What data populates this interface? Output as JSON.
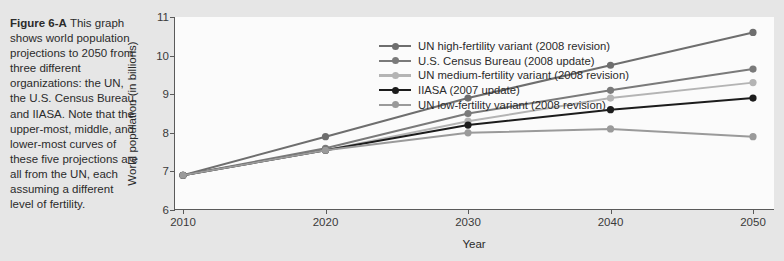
{
  "caption": {
    "label": "Figure 6-A",
    "text": "This graph shows world population projections to 2050 from three different organizations: the UN, the U.S. Census Bureau, and IIASA. Note that the upper-most, middle, and lower-most curves of these five projections are all from the UN, each assuming a different level of fertility."
  },
  "chart_data": {
    "type": "line",
    "title": "",
    "xlabel": "Year",
    "ylabel": "World population (in billions)",
    "x": [
      2010,
      2020,
      2030,
      2040,
      2050
    ],
    "xticklabels": [
      "2010",
      "2020",
      "2030",
      "2040",
      "2050"
    ],
    "yticklabels": [
      "6",
      "7",
      "8",
      "9",
      "10",
      "11"
    ],
    "yticks": [
      6,
      7,
      8,
      9,
      10,
      11
    ],
    "xlim": [
      2010,
      2050
    ],
    "ylim": [
      6,
      11
    ],
    "grid": false,
    "legend_position": "top-left inside plot area",
    "series": [
      {
        "name": "UN high-fertility variant (2008 revision)",
        "color": "#6e6e6e",
        "values": [
          6.9,
          7.9,
          8.9,
          9.75,
          10.6
        ]
      },
      {
        "name": "U.S. Census Bureau (2008 update)",
        "color": "#7a7a7a",
        "values": [
          6.9,
          7.6,
          8.5,
          9.1,
          9.65
        ]
      },
      {
        "name": "UN medium-fertility variant (2008 revision)",
        "color": "#b4b4b4",
        "values": [
          6.9,
          7.55,
          8.3,
          8.9,
          9.3
        ]
      },
      {
        "name": "IIASA (2007 update)",
        "color": "#1c1c1c",
        "values": [
          6.9,
          7.55,
          8.2,
          8.6,
          8.9
        ]
      },
      {
        "name": "UN low-fertility variant (2008 revision)",
        "color": "#9a9a9a",
        "values": [
          6.9,
          7.55,
          8.0,
          8.1,
          7.9
        ]
      }
    ]
  },
  "colors": {
    "page_background": "#e6e6e6",
    "plot_background": "#fbfbfb",
    "axis": "#5a5a5a",
    "text": "#2b2b2b"
  }
}
